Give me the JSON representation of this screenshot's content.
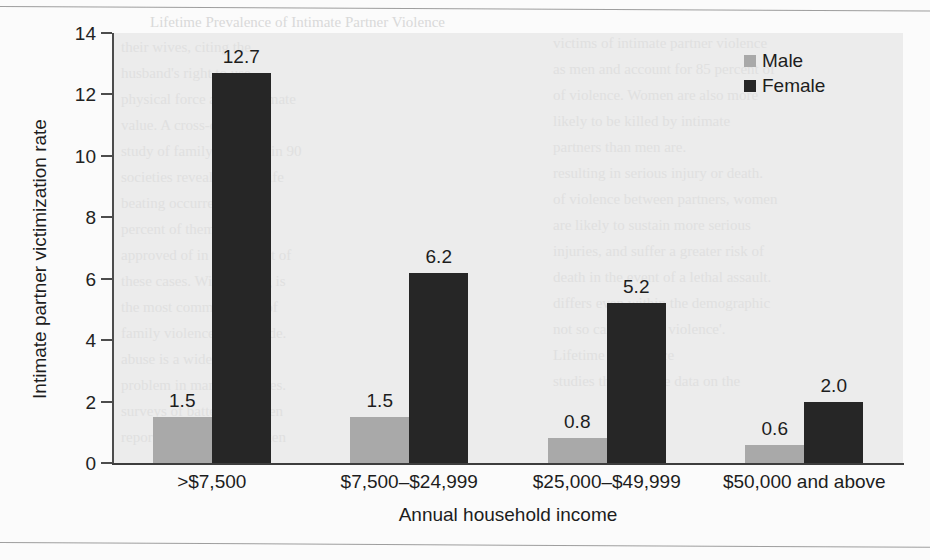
{
  "chart_data": {
    "type": "bar",
    "title": "",
    "xlabel": "Annual household income",
    "ylabel": "Intimate partner victimization rate",
    "categories": [
      ">$7,500",
      "$7,500–$24,999",
      "$25,000–$49,999",
      "$50,000 and above"
    ],
    "series": [
      {
        "name": "Male",
        "color": "#a9a9a9",
        "values": [
          1.5,
          1.5,
          0.8,
          0.6
        ],
        "labels": [
          "1.5",
          "1.5",
          "0.8",
          "0.6"
        ]
      },
      {
        "name": "Female",
        "color": "#262626",
        "values": [
          12.7,
          6.2,
          5.2,
          2.0
        ],
        "labels": [
          "12.7",
          "6.2",
          "5.2",
          "2.0"
        ]
      }
    ],
    "ylim": [
      0,
      14
    ],
    "yticks": [
      0,
      2,
      4,
      6,
      8,
      10,
      12,
      14
    ],
    "ytick_labels": [
      "0",
      "2",
      "4",
      "6",
      "8",
      "10",
      "12",
      "14"
    ],
    "grid": false,
    "legend_position": "top-right",
    "plot_background": "#ececec"
  },
  "legend": {
    "entries": [
      {
        "label": "Male",
        "swatch": "male-swatch"
      },
      {
        "label": "Female",
        "swatch": "female-swatch"
      }
    ]
  },
  "bleed_text": {
    "lines": [
      "their wives, citing the",
      "husband's right to use",
      "physical force as a legitimate",
      "value. A cross-cultural",
      "study of family violence in 90",
      "societies revealed that wife",
      "beating occurred in 85",
      "percent of them, and was",
      "approved of in 21 percent of",
      "these cases. Wife beating is",
      "the most common form of",
      "family violence worldwide.",
      "abuse is a widespread",
      "problem in many countries.",
      "surveys of battered women",
      "report that violence is often"
    ],
    "right_lines": [
      "victims of intimate partner violence",
      "as men and account for 85 percent of",
      "of violence. Women are also more",
      "likely to be killed by intimate",
      "partners than men are.",
      "resulting in serious injury or death.",
      "of violence between partners, women",
      "are likely to sustain more serious",
      "injuries, and suffer a greater risk of",
      "death in the event of a lethal assault.",
      "differs even within the demographic",
      "not so called 'male violence'.",
      "Lifetime Prevalence",
      "studies that provide data on the"
    ]
  }
}
